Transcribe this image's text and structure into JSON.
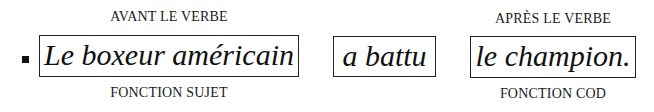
{
  "sentence": {
    "groups": [
      {
        "text": "Le boxeur américain",
        "above": "AVANT LE VERBE",
        "below": "FONCTION SUJET"
      },
      {
        "text": "a battu",
        "above": "",
        "below": ""
      },
      {
        "text": "le champion.",
        "above": "APRÈS LE VERBE",
        "below": "FONCTION COD"
      }
    ]
  },
  "bullet": "square-bullet"
}
